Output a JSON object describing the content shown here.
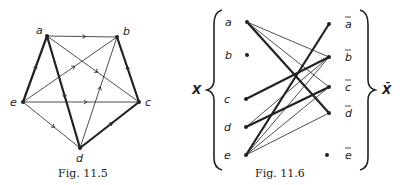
{
  "figures": [
    {
      "id": "fig-11-5",
      "caption": "Fig. 11.5",
      "type": "directed-graph",
      "vertices": [
        {
          "label": "a",
          "x": 47,
          "y": 36
        },
        {
          "label": "b",
          "x": 117,
          "y": 37
        },
        {
          "label": "c",
          "x": 139,
          "y": 102
        },
        {
          "label": "d",
          "x": 80,
          "y": 148
        },
        {
          "label": "e",
          "x": 23,
          "y": 102
        }
      ],
      "edges": [
        {
          "from": "a",
          "to": "b",
          "weight": "thin"
        },
        {
          "from": "a",
          "to": "c",
          "weight": "thin"
        },
        {
          "from": "a",
          "to": "d",
          "weight": "thick"
        },
        {
          "from": "c",
          "to": "b",
          "weight": "thick"
        },
        {
          "from": "d",
          "to": "b",
          "weight": "thin"
        },
        {
          "from": "e",
          "to": "b",
          "weight": "thin"
        },
        {
          "from": "e",
          "to": "c",
          "weight": "thin"
        },
        {
          "from": "d",
          "to": "c",
          "weight": "thick"
        },
        {
          "from": "e",
          "to": "a",
          "weight": "thick"
        },
        {
          "from": "e",
          "to": "d",
          "weight": "thin"
        }
      ]
    },
    {
      "id": "fig-11-6",
      "caption": "Fig. 11.6",
      "type": "bipartite-graph",
      "left_set_label": "X",
      "right_set_label": "X̄",
      "left": [
        {
          "label": "a",
          "x": 247,
          "y": 22
        },
        {
          "label": "b",
          "x": 247,
          "y": 55
        },
        {
          "label": "c",
          "x": 246,
          "y": 99
        },
        {
          "label": "d",
          "x": 246,
          "y": 127
        },
        {
          "label": "e",
          "x": 246,
          "y": 155
        }
      ],
      "right": [
        {
          "label": "a",
          "x": 329,
          "y": 24
        },
        {
          "label": "b",
          "x": 329,
          "y": 57
        },
        {
          "label": "c",
          "x": 329,
          "y": 87
        },
        {
          "label": "d",
          "x": 329,
          "y": 113
        },
        {
          "label": "e",
          "x": 327,
          "y": 155
        }
      ],
      "edges": [
        {
          "from": "a",
          "to": "b",
          "weight": "thin"
        },
        {
          "from": "a",
          "to": "c",
          "weight": "thin"
        },
        {
          "from": "a",
          "to": "d",
          "weight": "thick"
        },
        {
          "from": "c",
          "to": "b",
          "weight": "thick"
        },
        {
          "from": "d",
          "to": "b",
          "weight": "thin"
        },
        {
          "from": "d",
          "to": "c",
          "weight": "thick"
        },
        {
          "from": "e",
          "to": "a",
          "weight": "thick"
        },
        {
          "from": "e",
          "to": "b",
          "weight": "thin"
        },
        {
          "from": "e",
          "to": "c",
          "weight": "thin"
        },
        {
          "from": "e",
          "to": "d",
          "weight": "thin"
        }
      ]
    }
  ]
}
